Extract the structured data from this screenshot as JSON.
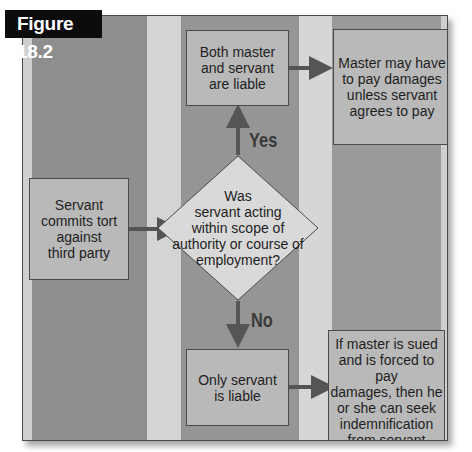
{
  "figure": {
    "label": "Figure 18.2"
  },
  "colors": {
    "band_dark": "#8f8f8f",
    "band_light": "#d3d3d3",
    "box_fill": "#b9b9b9",
    "diamond_fill": "#d9d9d9",
    "arrow": "#555555",
    "label_bg": "#0c0c0c"
  },
  "nodes": {
    "start": {
      "text": "Servant\ncommits tort\nagainst\nthird party"
    },
    "decision": {
      "text": "Was\nservant acting\nwithin scope of\nauthority or course of\nemployment?"
    },
    "both_liable": {
      "text": "Both master\nand servant\nare liable"
    },
    "master_pay": {
      "text": "Master may have\nto pay damages\nunless servant\nagrees to pay"
    },
    "only_servant": {
      "text": "Only servant\nis liable"
    },
    "indemnification": {
      "text": "If master is sued\nand is forced to pay\ndamages, then he\nor she can seek\nindemnification\nfrom servant"
    }
  },
  "edges": {
    "yes_label": "Yes",
    "no_label": "No"
  }
}
